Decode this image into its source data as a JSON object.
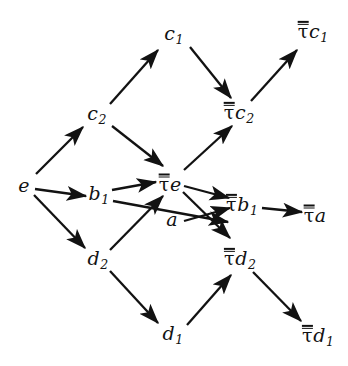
{
  "figure": {
    "kind": "commutative-diagram",
    "width": 348,
    "height": 366,
    "background": "#ffffff",
    "ink": "#121212"
  },
  "nodes": [
    {
      "id": "c1",
      "label": "c",
      "sub": "1",
      "tau": false,
      "x": 174,
      "y": 35,
      "name": "node-c1"
    },
    {
      "id": "tauc1",
      "label": "c",
      "sub": "1",
      "tau": true,
      "x": 313,
      "y": 32,
      "name": "node-tau-c1"
    },
    {
      "id": "c2",
      "label": "c",
      "sub": "2",
      "tau": false,
      "x": 97,
      "y": 115,
      "name": "node-c2"
    },
    {
      "id": "tauc2",
      "label": "c",
      "sub": "2",
      "tau": true,
      "x": 239,
      "y": 113,
      "name": "node-tau-c2"
    },
    {
      "id": "e",
      "label": "e",
      "sub": "",
      "tau": false,
      "x": 24,
      "y": 185,
      "name": "node-e"
    },
    {
      "id": "b1",
      "label": "b",
      "sub": "1",
      "tau": false,
      "x": 99,
      "y": 195,
      "name": "node-b1"
    },
    {
      "id": "taue",
      "label": "e",
      "sub": "",
      "tau": true,
      "x": 170,
      "y": 183,
      "name": "node-tau-e"
    },
    {
      "id": "a",
      "label": "a",
      "sub": "",
      "tau": false,
      "x": 172,
      "y": 219,
      "name": "node-a"
    },
    {
      "id": "taub1",
      "label": "b",
      "sub": "1",
      "tau": true,
      "x": 242,
      "y": 205,
      "name": "node-tau-b1"
    },
    {
      "id": "taua",
      "label": "a",
      "sub": "",
      "tau": true,
      "x": 315,
      "y": 214,
      "name": "node-tau-a"
    },
    {
      "id": "d2",
      "label": "d",
      "sub": "2",
      "tau": false,
      "x": 98,
      "y": 260,
      "name": "node-d2"
    },
    {
      "id": "taud2",
      "label": "d",
      "sub": "2",
      "tau": true,
      "x": 240,
      "y": 259,
      "name": "node-tau-d2"
    },
    {
      "id": "d1",
      "label": "d",
      "sub": "1",
      "tau": false,
      "x": 173,
      "y": 335,
      "name": "node-d1"
    },
    {
      "id": "taud1",
      "label": "d",
      "sub": "1",
      "tau": true,
      "x": 318,
      "y": 336,
      "name": "node-tau-d1"
    }
  ],
  "edges": [
    {
      "from": "e",
      "to": "c2",
      "x1": 36,
      "y1": 174,
      "x2": 83,
      "y2": 127,
      "name": "edge-e-to-c2"
    },
    {
      "from": "c2",
      "to": "c1",
      "x1": 110,
      "y1": 104,
      "x2": 158,
      "y2": 50,
      "name": "edge-c2-to-c1"
    },
    {
      "from": "c2",
      "to": "taue",
      "x1": 112,
      "y1": 126,
      "x2": 163,
      "y2": 166,
      "name": "edge-c2-to-tau-e"
    },
    {
      "from": "c1",
      "to": "tauc2",
      "x1": 190,
      "y1": 47,
      "x2": 231,
      "y2": 98,
      "name": "edge-c1-to-tau-c2"
    },
    {
      "from": "tauc2",
      "to": "tauc1",
      "x1": 251,
      "y1": 101,
      "x2": 297,
      "y2": 50,
      "name": "edge-tau-c2-to-tau-c1"
    },
    {
      "from": "taue",
      "to": "tauc2",
      "x1": 184,
      "y1": 170,
      "x2": 232,
      "y2": 126,
      "name": "edge-tau-e-to-tau-c2"
    },
    {
      "from": "e",
      "to": "b1",
      "x1": 35,
      "y1": 189,
      "x2": 86,
      "y2": 196,
      "name": "edge-e-to-b1"
    },
    {
      "from": "e",
      "to": "d2",
      "x1": 34,
      "y1": 195,
      "x2": 85,
      "y2": 248,
      "name": "edge-e-to-d2"
    },
    {
      "from": "b1",
      "to": "taue",
      "x1": 112,
      "y1": 190,
      "x2": 156,
      "y2": 182,
      "name": "edge-b1-to-tau-e"
    },
    {
      "from": "b1",
      "to": "taub1",
      "x1": 113,
      "y1": 201,
      "x2": 228,
      "y2": 222,
      "name": "edge-b1-to-tau-b1"
    },
    {
      "from": "d2",
      "to": "taue",
      "x1": 110,
      "y1": 250,
      "x2": 163,
      "y2": 196,
      "name": "edge-d2-to-tau-e"
    },
    {
      "from": "taue",
      "to": "taub1",
      "x1": 184,
      "y1": 186,
      "x2": 229,
      "y2": 198,
      "name": "edge-tau-e-to-tau-b1"
    },
    {
      "from": "taue",
      "to": "taud2",
      "x1": 183,
      "y1": 192,
      "x2": 230,
      "y2": 238,
      "name": "edge-tau-e-to-tau-d2"
    },
    {
      "from": "a",
      "to": "taub1",
      "x1": 184,
      "y1": 221,
      "x2": 230,
      "y2": 208,
      "name": "edge-a-to-tau-b1"
    },
    {
      "from": "taub1",
      "to": "taua",
      "x1": 262,
      "y1": 208,
      "x2": 302,
      "y2": 212,
      "name": "edge-tau-b1-to-tau-a"
    },
    {
      "from": "d2",
      "to": "d1",
      "x1": 110,
      "y1": 271,
      "x2": 158,
      "y2": 323,
      "name": "edge-d2-to-d1"
    },
    {
      "from": "d1",
      "to": "taud2",
      "x1": 187,
      "y1": 325,
      "x2": 231,
      "y2": 275,
      "name": "edge-d1-to-tau-d2"
    },
    {
      "from": "taud2",
      "to": "taud1",
      "x1": 253,
      "y1": 272,
      "x2": 301,
      "y2": 321,
      "name": "edge-tau-d2-to-tau-d1"
    }
  ]
}
